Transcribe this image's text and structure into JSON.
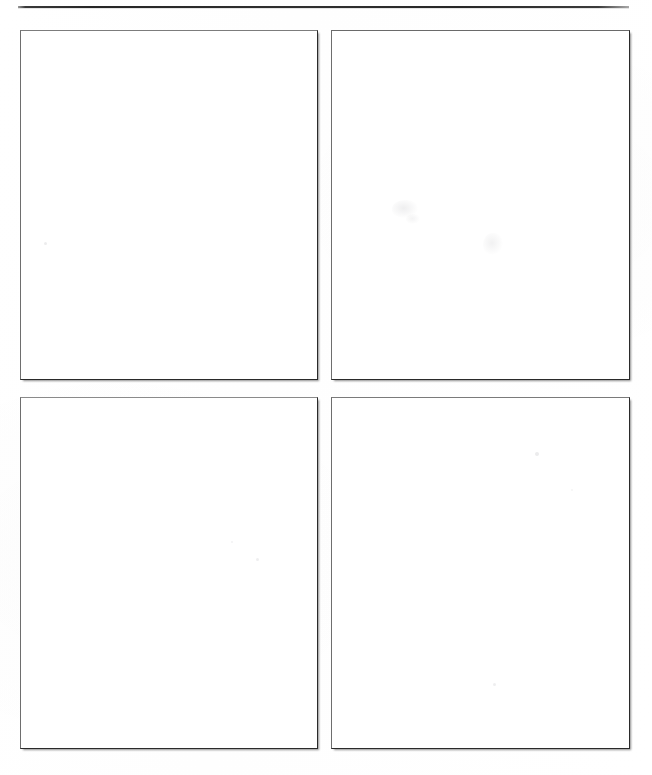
{
  "document": {
    "kind": "scanned-page",
    "page_background": "#ffffff",
    "width": 652,
    "height": 775,
    "caption": "",
    "visible_text": ""
  },
  "rule": {
    "name": "top-horizontal-rule",
    "color": "#2a2a2a",
    "x": 18,
    "y": 6,
    "width": 611,
    "thickness": 2
  },
  "frames": [
    {
      "id": "frame-top-left",
      "position": "top-left",
      "x": 20,
      "y": 30,
      "width": 296,
      "height": 348,
      "fill": "#ffffff",
      "border_color": "#2a2a2a",
      "content": ""
    },
    {
      "id": "frame-top-right",
      "position": "top-right",
      "x": 331,
      "y": 30,
      "width": 297,
      "height": 348,
      "fill": "#ffffff",
      "border_color": "#2a2a2a",
      "content": ""
    },
    {
      "id": "frame-bottom-left",
      "position": "bottom-left",
      "x": 20,
      "y": 397,
      "width": 296,
      "height": 350,
      "fill": "#ffffff",
      "border_color": "#2a2a2a",
      "content": ""
    },
    {
      "id": "frame-bottom-right",
      "position": "bottom-right",
      "x": 331,
      "y": 397,
      "width": 297,
      "height": 350,
      "fill": "#ffffff",
      "border_color": "#2a2a2a",
      "content": ""
    }
  ],
  "artifacts": [
    {
      "id": "speck-1",
      "x": 44,
      "y": 242,
      "size": 3,
      "opacity": 0.1
    },
    {
      "id": "speck-2",
      "x": 256,
      "y": 558,
      "size": 3,
      "opacity": 0.09
    },
    {
      "id": "speck-3",
      "x": 231,
      "y": 541,
      "size": 2,
      "opacity": 0.07
    },
    {
      "id": "speck-4",
      "x": 535,
      "y": 452,
      "size": 4,
      "opacity": 0.1
    },
    {
      "id": "speck-5",
      "x": 493,
      "y": 683,
      "size": 3,
      "opacity": 0.09
    },
    {
      "id": "speck-6",
      "x": 571,
      "y": 489,
      "size": 2,
      "opacity": 0.06
    },
    {
      "id": "smudge-1",
      "x": 392,
      "y": 200,
      "width": 26,
      "height": 18,
      "opacity": 0.085
    },
    {
      "id": "smudge-2",
      "x": 483,
      "y": 233,
      "width": 20,
      "height": 22,
      "opacity": 0.07
    },
    {
      "id": "smudge-3",
      "x": 406,
      "y": 214,
      "width": 14,
      "height": 10,
      "opacity": 0.06
    }
  ]
}
